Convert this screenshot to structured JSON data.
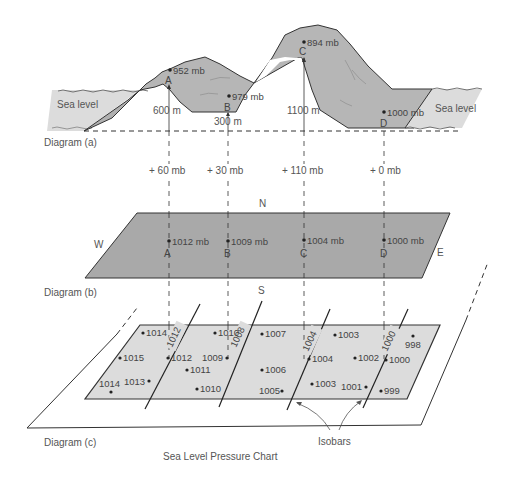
{
  "colors": {
    "terrain": "#b6b6b6",
    "sea": "#d9d9d9",
    "plate_b": "#a9a9a9",
    "plate_c": "#dcdcdc",
    "line": "#333333",
    "text": "#555555"
  },
  "diagram_a": {
    "label": "Diagram (a)",
    "sea_level_left": "Sea level",
    "sea_level_right": "Sea level",
    "stations": [
      {
        "letter": "A",
        "pressure": "952 mb",
        "elevation": "600 m"
      },
      {
        "letter": "B",
        "pressure": "979 mb",
        "elevation": "300 m"
      },
      {
        "letter": "C",
        "pressure": "894 mb",
        "elevation": "1100 m"
      },
      {
        "letter": "D",
        "pressure": "1000 mb",
        "elevation": ""
      }
    ]
  },
  "corrections": [
    "+ 60 mb",
    "+ 30 mb",
    "+ 110 mb",
    "+ 0 mb"
  ],
  "diagram_b": {
    "label": "Diagram (b)",
    "compass": {
      "n": "N",
      "s": "S",
      "e": "E",
      "w": "W"
    },
    "stations": [
      {
        "letter": "A",
        "pressure": "1012 mb"
      },
      {
        "letter": "B",
        "pressure": "1009 mb"
      },
      {
        "letter": "C",
        "pressure": "1004 mb"
      },
      {
        "letter": "D",
        "pressure": "1000 mb"
      }
    ]
  },
  "diagram_c": {
    "label": "Diagram (c)",
    "title": "Sea Level Pressure Chart",
    "isobars_label": "Isobars",
    "isobar_values": [
      "1012",
      "1008",
      "1004",
      "1000"
    ],
    "points": [
      "1014",
      "1010",
      "1007",
      "1003",
      "998",
      "1015",
      "1012",
      "1009",
      "1004",
      "1002",
      "1000",
      "1011",
      "1006",
      "1014",
      "1013",
      "1010",
      "1005",
      "1003",
      "1001",
      "999"
    ]
  }
}
